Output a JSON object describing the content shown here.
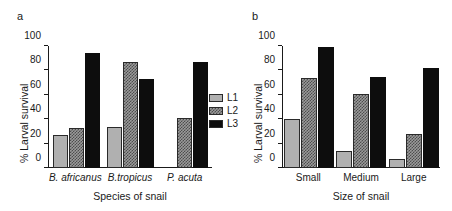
{
  "figure": {
    "legend": {
      "entries": [
        {
          "label": "L1",
          "swatch": "light-gray-solid"
        },
        {
          "label": "L2",
          "swatch": "gray-hatched"
        },
        {
          "label": "L3",
          "swatch": "black-solid"
        }
      ]
    },
    "panels": [
      {
        "letter": "a",
        "chart_data": {
          "type": "bar",
          "title": "",
          "xlabel": "Species of snail",
          "ylabel": "% Larval survival",
          "categories": [
            "B. africanus",
            "B.tropicus",
            "P. acuta"
          ],
          "series": [
            {
              "name": "L1",
              "values": [
                27,
                34,
                null
              ]
            },
            {
              "name": "L2",
              "values": [
                33,
                87,
                41
              ]
            },
            {
              "name": "L3",
              "values": [
                94,
                73,
                87
              ]
            }
          ],
          "ylim": [
            0,
            100
          ],
          "yticks": [
            0,
            20,
            40,
            60,
            80,
            100
          ],
          "grid": false,
          "legend_position": "right"
        }
      },
      {
        "letter": "b",
        "chart_data": {
          "type": "bar",
          "title": "",
          "xlabel": "Size of snail",
          "ylabel": "% Larval survival",
          "categories": [
            "Small",
            "Medium",
            "Large"
          ],
          "series": [
            {
              "name": "L1",
              "values": [
                40,
                14,
                7
              ]
            },
            {
              "name": "L2",
              "values": [
                74,
                61,
                28
              ]
            },
            {
              "name": "L3",
              "values": [
                99,
                75,
                82
              ]
            }
          ],
          "ylim": [
            0,
            100
          ],
          "yticks": [
            0,
            20,
            40,
            60,
            80,
            100
          ],
          "grid": false,
          "legend_position": "left-of-panel"
        }
      }
    ]
  },
  "chart_data": [
    {
      "type": "bar",
      "panel": "a",
      "title": "",
      "xlabel": "Species of snail",
      "ylabel": "% Larval survival",
      "categories": [
        "B. africanus",
        "B.tropicus",
        "P. acuta"
      ],
      "series": [
        {
          "name": "L1",
          "values": [
            27,
            34,
            null
          ]
        },
        {
          "name": "L2",
          "values": [
            33,
            87,
            41
          ]
        },
        {
          "name": "L3",
          "values": [
            94,
            73,
            87
          ]
        }
      ],
      "ylim": [
        0,
        100
      ],
      "yticks": [
        0,
        20,
        40,
        60,
        80,
        100
      ],
      "grid": false
    },
    {
      "type": "bar",
      "panel": "b",
      "title": "",
      "xlabel": "Size of snail",
      "ylabel": "% Larval survival",
      "categories": [
        "Small",
        "Medium",
        "Large"
      ],
      "series": [
        {
          "name": "L1",
          "values": [
            40,
            14,
            7
          ]
        },
        {
          "name": "L2",
          "values": [
            74,
            61,
            28
          ]
        },
        {
          "name": "L3",
          "values": [
            99,
            75,
            82
          ]
        }
      ],
      "ylim": [
        0,
        100
      ],
      "yticks": [
        0,
        20,
        40,
        60,
        80,
        100
      ],
      "grid": false
    }
  ]
}
